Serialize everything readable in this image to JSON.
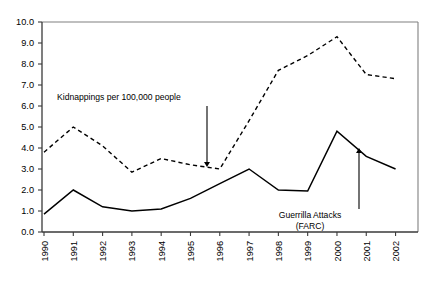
{
  "chart_data": {
    "type": "line",
    "title": "",
    "subtitle": "",
    "xlabel": "",
    "ylabel": "",
    "xlim": [
      1990,
      2002
    ],
    "ylim": [
      0.0,
      10.0
    ],
    "grid": false,
    "legend_position": "none",
    "categories": [
      "1990",
      "1991",
      "1992",
      "1993",
      "1994",
      "1995",
      "1996",
      "1997",
      "1998",
      "1999",
      "2000",
      "2001",
      "2002"
    ],
    "x": [
      1990,
      1991,
      1992,
      1993,
      1994,
      1995,
      1996,
      1997,
      1998,
      1999,
      2000,
      2001,
      2002
    ],
    "ytick_labels": [
      "10.0",
      "9.0",
      "8.0",
      "7.0",
      "6.0",
      "5.0",
      "4.0",
      "3.0",
      "2.0",
      "1.0",
      "0.0"
    ],
    "ytick_values": [
      10.0,
      9.0,
      8.0,
      7.0,
      6.0,
      5.0,
      4.0,
      3.0,
      2.0,
      1.0,
      0.0
    ],
    "series": [
      {
        "name": "Kidnappings per 100,000 people",
        "style": "dashed",
        "color": "#000000",
        "values": [
          3.8,
          5.0,
          4.1,
          2.85,
          3.5,
          3.2,
          3.0,
          5.3,
          7.7,
          8.4,
          9.3,
          7.5,
          7.3
        ]
      },
      {
        "name": "Guerrilla Attacks (FARC)",
        "style": "solid",
        "color": "#000000",
        "values": [
          0.85,
          2.0,
          1.2,
          1.0,
          1.1,
          1.6,
          2.3,
          3.0,
          2.0,
          1.95,
          4.8,
          3.6,
          3.0
        ]
      }
    ],
    "annotations": [
      {
        "id": "kidnappings",
        "text": "Kidnappings per 100,000 people",
        "text_x": 57,
        "text_y": 100,
        "arrow_from_x": 207,
        "arrow_from_y": 106,
        "arrow_to_x": 207,
        "arrow_to_y": 167
      },
      {
        "id": "guerrilla",
        "text_line1": "Guerrilla Attacks",
        "text_line2": "(FARC)",
        "text_x": 310,
        "text_y": 218,
        "arrow_from_x": 359,
        "arrow_from_y": 209,
        "arrow_to_x": 359,
        "arrow_to_y": 148
      }
    ]
  },
  "axes": {
    "plot_left": 42,
    "plot_right": 418,
    "plot_top": 22,
    "plot_bottom": 232
  }
}
